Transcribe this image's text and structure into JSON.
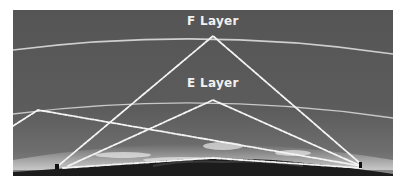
{
  "diagram": {
    "layers": [
      {
        "name": "F Layer",
        "label": "F Layer"
      },
      {
        "name": "E Layer",
        "label": "E Layer"
      }
    ],
    "colors": {
      "sky": "#5a5a5a",
      "layer_line": "#cfcfcf",
      "wave": "#f4f4f4",
      "ground": "#1c1c1c"
    }
  }
}
